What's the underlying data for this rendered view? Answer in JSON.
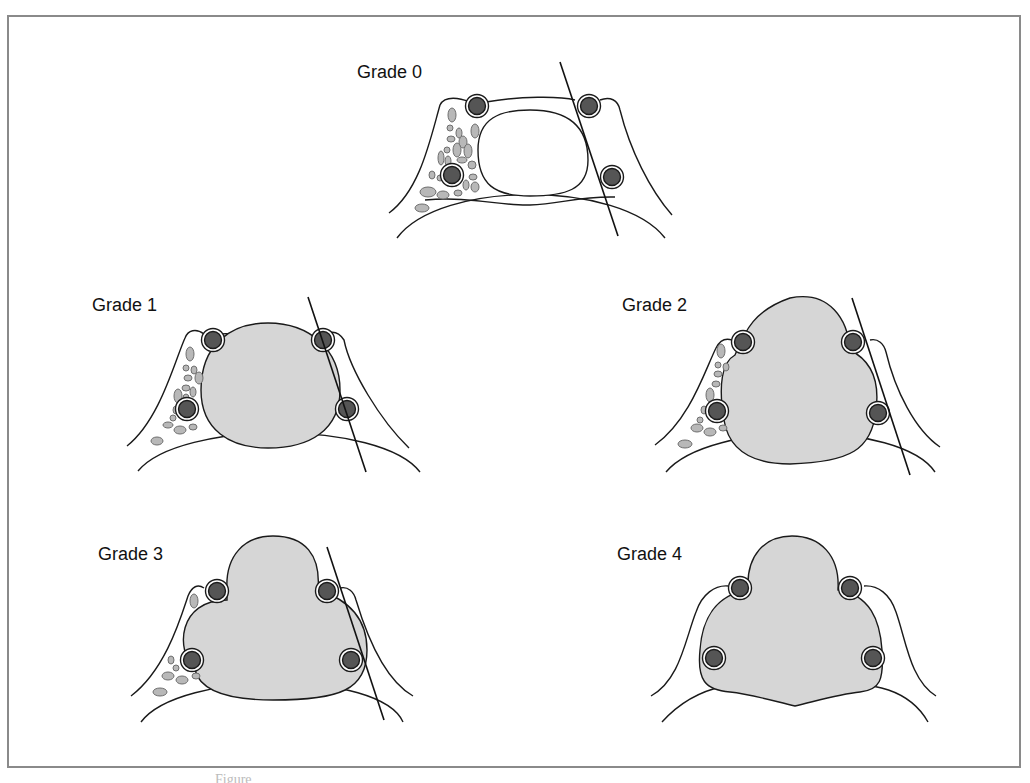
{
  "figure": {
    "panels": [
      {
        "id": "grade-0",
        "label": "Grade 0"
      },
      {
        "id": "grade-1",
        "label": "Grade 1"
      },
      {
        "id": "grade-2",
        "label": "Grade 2"
      },
      {
        "id": "grade-3",
        "label": "Grade 3"
      },
      {
        "id": "grade-4",
        "label": "Grade 4"
      }
    ],
    "caption": "Figure"
  },
  "colors": {
    "frame": "#8a8a8a",
    "outline": "#1a1a1a",
    "tumor_fill": "#d6d6d6",
    "vessel_fill": "#555555",
    "fat_fill": "#b8b8b8",
    "fat_stroke": "#6e6e6e"
  }
}
